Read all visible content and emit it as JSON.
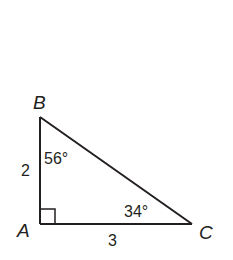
{
  "diagram": {
    "type": "right-triangle",
    "colors": {
      "stroke": "#231f20",
      "background": "#ffffff"
    },
    "vertices": [
      {
        "name": "A",
        "label": "A",
        "x": 40,
        "y": 224,
        "right_angle": true
      },
      {
        "name": "B",
        "label": "B",
        "x": 40,
        "y": 117
      },
      {
        "name": "C",
        "label": "C",
        "x": 192,
        "y": 224
      }
    ],
    "sides": [
      {
        "from": "A",
        "to": "B",
        "label": "2"
      },
      {
        "from": "A",
        "to": "C",
        "label": "3"
      },
      {
        "from": "B",
        "to": "C",
        "label": ""
      }
    ],
    "angles": [
      {
        "vertex": "B",
        "label": "56°"
      },
      {
        "vertex": "C",
        "label": "34°"
      },
      {
        "vertex": "A",
        "label": "",
        "marker": "right-angle-square"
      }
    ]
  }
}
